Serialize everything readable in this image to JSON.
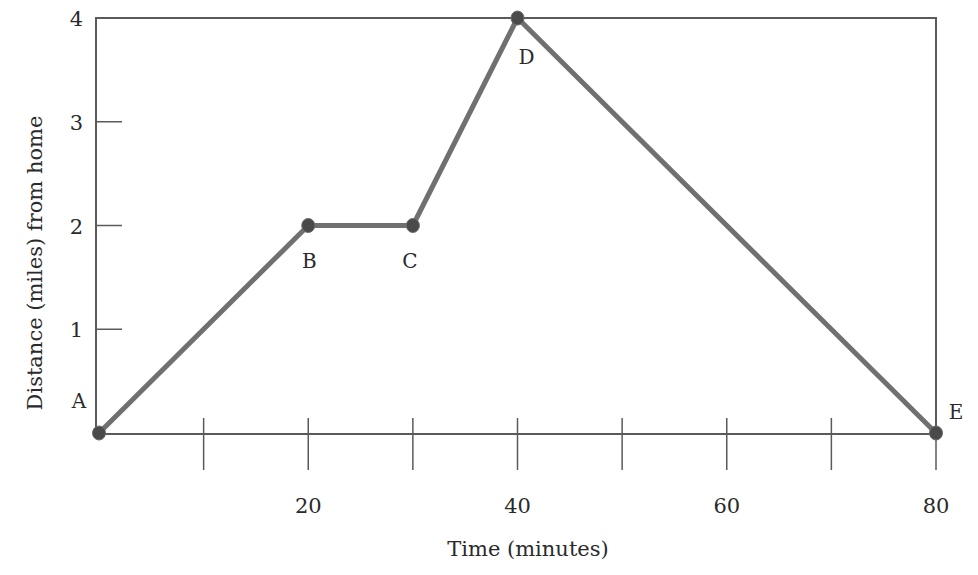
{
  "chart_data": {
    "type": "line",
    "title": "",
    "xlabel": "Time (minutes)",
    "ylabel": "Distance (miles) from home",
    "xlim": [
      0,
      80
    ],
    "ylim": [
      0,
      4
    ],
    "grid": false,
    "legend": null,
    "x_ticks": [
      10,
      20,
      30,
      40,
      50,
      60,
      70,
      80
    ],
    "x_tick_labels": [
      {
        "value": 20,
        "label": "20"
      },
      {
        "value": 40,
        "label": "40"
      },
      {
        "value": 60,
        "label": "60"
      },
      {
        "value": 80,
        "label": "80"
      }
    ],
    "y_ticks": [
      1,
      2,
      3,
      4
    ],
    "y_tick_labels": [
      {
        "value": 1,
        "label": "1"
      },
      {
        "value": 2,
        "label": "2"
      },
      {
        "value": 3,
        "label": "3"
      },
      {
        "value": 4,
        "label": "4"
      }
    ],
    "series": [
      {
        "name": "Trip",
        "points": [
          {
            "label": "A",
            "x": 0,
            "y": 0
          },
          {
            "label": "B",
            "x": 20,
            "y": 2
          },
          {
            "label": "C",
            "x": 30,
            "y": 2
          },
          {
            "label": "D",
            "x": 40,
            "y": 4
          },
          {
            "label": "E",
            "x": 80,
            "y": 0
          }
        ]
      }
    ],
    "colors": {
      "line": "#707070",
      "marker": "#4a4a4a",
      "axis": "#5a5a5a",
      "text": "#2a2a2a"
    }
  }
}
